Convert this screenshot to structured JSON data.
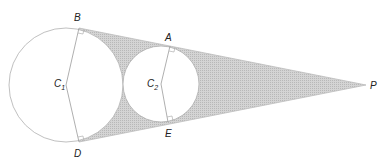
{
  "diagram": {
    "colors": {
      "stroke": "#9a9a9a",
      "shade": "#c8c8c8",
      "circle_fill": "#ffffff",
      "label": "#222222"
    },
    "points": {
      "B": {
        "label": "B",
        "x": 79,
        "y": 28
      },
      "D": {
        "label": "D",
        "x": 79,
        "y": 142
      },
      "A": {
        "label": "A",
        "x": 170,
        "y": 46
      },
      "E": {
        "label": "E",
        "x": 168,
        "y": 122
      },
      "P": {
        "label": "P",
        "x": 366,
        "y": 85
      }
    },
    "circles": [
      {
        "name": "C1",
        "label_main": "C",
        "label_sub": "1",
        "cx": 66,
        "cy": 85,
        "r": 57
      },
      {
        "name": "C2",
        "label_main": "C",
        "label_sub": "2",
        "cx": 161,
        "cy": 84,
        "r": 38
      }
    ],
    "right_angle_marks": [
      "B",
      "D",
      "A",
      "E"
    ]
  }
}
